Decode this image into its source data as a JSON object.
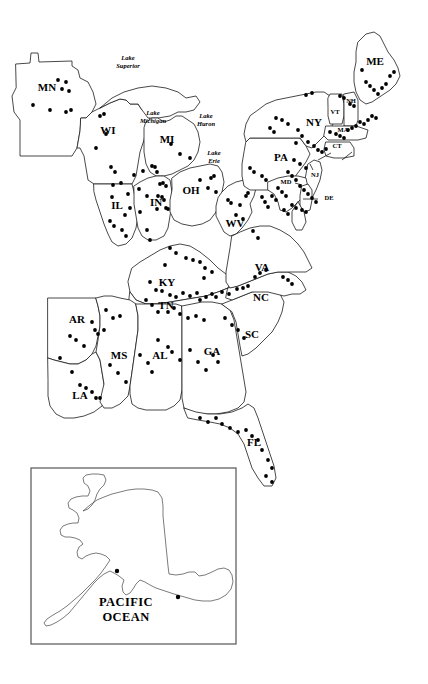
{
  "figure": {
    "kind": "distribution-point-map",
    "region": "Eastern United States",
    "background_color": "#ffffff",
    "outline_color": "#1a1a1a",
    "dot_color": "#000000"
  },
  "state_labels": [
    {
      "code": "MN",
      "x": 47,
      "y": 88,
      "size": "normal"
    },
    {
      "code": "WI",
      "x": 108,
      "y": 131,
      "size": "normal"
    },
    {
      "code": "MI",
      "x": 167,
      "y": 140,
      "size": "normal"
    },
    {
      "code": "IL",
      "x": 117,
      "y": 206,
      "size": "normal"
    },
    {
      "code": "IN",
      "x": 156,
      "y": 203,
      "size": "normal"
    },
    {
      "code": "OH",
      "x": 191,
      "y": 191,
      "size": "normal"
    },
    {
      "code": "WV",
      "x": 235,
      "y": 224,
      "size": "normal"
    },
    {
      "code": "KY",
      "x": 167,
      "y": 283,
      "size": "normal"
    },
    {
      "code": "TN",
      "x": 166,
      "y": 306,
      "size": "normal"
    },
    {
      "code": "AR",
      "x": 77,
      "y": 320,
      "size": "normal"
    },
    {
      "code": "MS",
      "x": 119,
      "y": 356,
      "size": "normal"
    },
    {
      "code": "AL",
      "x": 160,
      "y": 356,
      "size": "normal"
    },
    {
      "code": "LA",
      "x": 80,
      "y": 396,
      "size": "normal"
    },
    {
      "code": "GA",
      "x": 212,
      "y": 352,
      "size": "normal"
    },
    {
      "code": "FL",
      "x": 254,
      "y": 443,
      "size": "normal"
    },
    {
      "code": "SC",
      "x": 252,
      "y": 335,
      "size": "normal"
    },
    {
      "code": "NC",
      "x": 261,
      "y": 298,
      "size": "normal"
    },
    {
      "code": "VA",
      "x": 262,
      "y": 268,
      "size": "normal"
    },
    {
      "code": "PA",
      "x": 281,
      "y": 158,
      "size": "normal"
    },
    {
      "code": "NY",
      "x": 314,
      "y": 123,
      "size": "normal"
    },
    {
      "code": "ME",
      "x": 375,
      "y": 62,
      "size": "normal"
    },
    {
      "code": "VT",
      "x": 335,
      "y": 113,
      "size": "tiny"
    },
    {
      "code": "NH",
      "x": 351,
      "y": 102,
      "size": "tiny"
    },
    {
      "code": "MA",
      "x": 343,
      "y": 131,
      "size": "tiny"
    },
    {
      "code": "CT",
      "x": 337,
      "y": 147,
      "size": "tiny"
    },
    {
      "code": "NJ",
      "x": 315,
      "y": 176,
      "size": "tiny"
    },
    {
      "code": "MD",
      "x": 286,
      "y": 183,
      "size": "tiny"
    },
    {
      "code": "DE",
      "x": 329,
      "y": 199,
      "size": "tiny"
    }
  ],
  "lake_labels": [
    {
      "name": "Lake Superior",
      "line1": "Lake",
      "line2": "Superior",
      "x": 128,
      "y": 60
    },
    {
      "name": "Lake Michigan",
      "line1": "Lake",
      "line2": "Michigan",
      "x": 153,
      "y": 115
    },
    {
      "name": "Lake Huron",
      "line1": "Lake",
      "line2": "Huron",
      "x": 206,
      "y": 118
    },
    {
      "name": "Lake Erie",
      "line1": "Lake",
      "line2": "Erie",
      "x": 214,
      "y": 155
    }
  ],
  "inset": {
    "name": "Alaska inset",
    "frame": {
      "x": 31,
      "y": 468,
      "width": 205,
      "height": 176
    },
    "ocean_label": {
      "line1": "PACIFIC",
      "line2": "OCEAN",
      "x": 126,
      "y": 606
    }
  },
  "leader_lines": [
    {
      "name": "de-leader",
      "x1": 318,
      "y1": 199,
      "x2": 304,
      "y2": 199
    },
    {
      "name": "md-leader",
      "x1": 294,
      "y1": 183,
      "x2": 300,
      "y2": 184
    }
  ],
  "chart_data": {
    "type": "scatter",
    "title": "",
    "xlabel": "",
    "ylabel": "",
    "point_radius": 1.9,
    "points": [
      [
        58,
        80
      ],
      [
        66,
        82
      ],
      [
        62,
        89
      ],
      [
        33,
        105
      ],
      [
        50,
        110
      ],
      [
        66,
        112
      ],
      [
        69,
        91
      ],
      [
        71,
        110
      ],
      [
        100,
        116
      ],
      [
        104,
        114
      ],
      [
        106,
        134
      ],
      [
        96,
        148
      ],
      [
        111,
        167
      ],
      [
        115,
        172
      ],
      [
        113,
        185
      ],
      [
        121,
        183
      ],
      [
        112,
        197
      ],
      [
        134,
        175
      ],
      [
        143,
        171
      ],
      [
        139,
        189
      ],
      [
        152,
        166
      ],
      [
        155,
        167
      ],
      [
        157,
        172
      ],
      [
        160,
        184
      ],
      [
        163,
        183
      ],
      [
        166,
        186
      ],
      [
        147,
        196
      ],
      [
        158,
        196
      ],
      [
        162,
        197
      ],
      [
        164,
        200
      ],
      [
        166,
        208
      ],
      [
        168,
        209
      ],
      [
        157,
        209
      ],
      [
        128,
        194
      ],
      [
        130,
        208
      ],
      [
        125,
        215
      ],
      [
        110,
        221
      ],
      [
        114,
        226
      ],
      [
        122,
        230
      ],
      [
        126,
        236
      ],
      [
        140,
        212
      ],
      [
        147,
        230
      ],
      [
        150,
        240
      ],
      [
        171,
        144
      ],
      [
        180,
        154
      ],
      [
        190,
        158
      ],
      [
        200,
        180
      ],
      [
        211,
        178
      ],
      [
        214,
        176
      ],
      [
        208,
        188
      ],
      [
        216,
        192
      ],
      [
        228,
        200
      ],
      [
        231,
        203
      ],
      [
        240,
        205
      ],
      [
        246,
        196
      ],
      [
        248,
        193
      ],
      [
        236,
        215
      ],
      [
        243,
        219
      ],
      [
        262,
        197
      ],
      [
        265,
        202
      ],
      [
        268,
        207
      ],
      [
        253,
        231
      ],
      [
        258,
        238
      ],
      [
        170,
        248
      ],
      [
        176,
        253
      ],
      [
        165,
        265
      ],
      [
        186,
        258
      ],
      [
        193,
        260
      ],
      [
        200,
        262
      ],
      [
        205,
        268
      ],
      [
        212,
        272
      ],
      [
        204,
        278
      ],
      [
        150,
        282
      ],
      [
        156,
        290
      ],
      [
        162,
        291
      ],
      [
        170,
        295
      ],
      [
        176,
        297
      ],
      [
        183,
        293
      ],
      [
        190,
        296
      ],
      [
        197,
        293
      ],
      [
        200,
        300
      ],
      [
        206,
        297
      ],
      [
        212,
        294
      ],
      [
        216,
        297
      ],
      [
        222,
        292
      ],
      [
        229,
        294
      ],
      [
        237,
        289
      ],
      [
        243,
        288
      ],
      [
        248,
        286
      ],
      [
        255,
        277
      ],
      [
        260,
        273
      ],
      [
        266,
        270
      ],
      [
        283,
        277
      ],
      [
        288,
        280
      ],
      [
        292,
        284
      ],
      [
        146,
        300
      ],
      [
        152,
        305
      ],
      [
        158,
        312
      ],
      [
        168,
        312
      ],
      [
        174,
        308
      ],
      [
        180,
        314
      ],
      [
        188,
        318
      ],
      [
        196,
        316
      ],
      [
        204,
        320
      ],
      [
        106,
        310
      ],
      [
        113,
        318
      ],
      [
        120,
        316
      ],
      [
        92,
        322
      ],
      [
        95,
        330
      ],
      [
        98,
        334
      ],
      [
        104,
        330
      ],
      [
        70,
        336
      ],
      [
        76,
        340
      ],
      [
        84,
        346
      ],
      [
        60,
        358
      ],
      [
        72,
        372
      ],
      [
        80,
        385
      ],
      [
        86,
        388
      ],
      [
        92,
        392
      ],
      [
        96,
        398
      ],
      [
        100,
        398
      ],
      [
        110,
        365
      ],
      [
        118,
        373
      ],
      [
        126,
        382
      ],
      [
        140,
        355
      ],
      [
        148,
        363
      ],
      [
        152,
        372
      ],
      [
        158,
        340
      ],
      [
        168,
        347
      ],
      [
        172,
        352
      ],
      [
        180,
        360
      ],
      [
        190,
        350
      ],
      [
        198,
        362
      ],
      [
        206,
        370
      ],
      [
        213,
        355
      ],
      [
        218,
        362
      ],
      [
        225,
        318
      ],
      [
        232,
        325
      ],
      [
        238,
        330
      ],
      [
        244,
        338
      ],
      [
        200,
        418
      ],
      [
        208,
        422
      ],
      [
        216,
        418
      ],
      [
        222,
        424
      ],
      [
        230,
        428
      ],
      [
        238,
        432
      ],
      [
        246,
        430
      ],
      [
        252,
        436
      ],
      [
        258,
        440
      ],
      [
        262,
        450
      ],
      [
        268,
        460
      ],
      [
        272,
        468
      ],
      [
        266,
        476
      ],
      [
        272,
        482
      ],
      [
        298,
        130
      ],
      [
        302,
        136
      ],
      [
        296,
        143
      ],
      [
        308,
        142
      ],
      [
        314,
        146
      ],
      [
        318,
        150
      ],
      [
        322,
        152
      ],
      [
        326,
        149
      ],
      [
        330,
        132
      ],
      [
        336,
        134
      ],
      [
        340,
        136
      ],
      [
        344,
        138
      ],
      [
        348,
        130
      ],
      [
        352,
        128
      ],
      [
        356,
        126
      ],
      [
        360,
        122
      ],
      [
        364,
        124
      ],
      [
        368,
        120
      ],
      [
        372,
        116
      ],
      [
        376,
        118
      ],
      [
        350,
        104
      ],
      [
        354,
        106
      ],
      [
        362,
        70
      ],
      [
        366,
        82
      ],
      [
        370,
        86
      ],
      [
        374,
        90
      ],
      [
        378,
        94
      ],
      [
        382,
        88
      ],
      [
        386,
        84
      ],
      [
        390,
        76
      ],
      [
        394,
        72
      ],
      [
        340,
        96
      ],
      [
        344,
        98
      ],
      [
        306,
        95
      ],
      [
        312,
        93
      ],
      [
        276,
        118
      ],
      [
        282,
        120
      ],
      [
        288,
        124
      ],
      [
        270,
        128
      ],
      [
        274,
        132
      ],
      [
        294,
        160
      ],
      [
        300,
        164
      ],
      [
        306,
        168
      ],
      [
        288,
        172
      ],
      [
        292,
        176
      ],
      [
        296,
        180
      ],
      [
        300,
        186
      ],
      [
        304,
        190
      ],
      [
        308,
        194
      ],
      [
        312,
        198
      ],
      [
        316,
        202
      ],
      [
        278,
        188
      ],
      [
        282,
        192
      ],
      [
        286,
        196
      ],
      [
        272,
        196
      ],
      [
        276,
        200
      ],
      [
        292,
        205
      ],
      [
        296,
        208
      ],
      [
        302,
        210
      ],
      [
        306,
        212
      ],
      [
        284,
        210
      ],
      [
        288,
        214
      ],
      [
        262,
        176
      ],
      [
        266,
        180
      ],
      [
        250,
        168
      ],
      [
        254,
        172
      ]
    ],
    "inset_points": [
      [
        117,
        571
      ],
      [
        178,
        597
      ]
    ]
  }
}
